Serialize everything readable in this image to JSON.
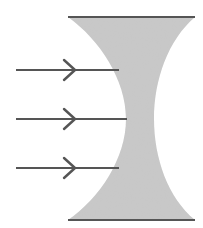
{
  "diagram": {
    "description": "Diverging (biconcave) lens with three parallel incoming rays",
    "colors": {
      "background": "#ffffff",
      "lens_fill": "#c9c9c9",
      "lens_edge": "#555555",
      "ray": "#555555"
    },
    "lens": {
      "type": "biconcave",
      "top_y": 17,
      "bottom_y": 220,
      "left_x": 68,
      "right_x": 195,
      "waist_left_x": 126,
      "waist_right_x": 154
    },
    "rays": [
      {
        "y": 70,
        "x_start": 16,
        "x_end": 119,
        "arrow_x": 75,
        "direction": "right"
      },
      {
        "y": 119,
        "x_start": 16,
        "x_end": 127,
        "arrow_x": 75,
        "direction": "right"
      },
      {
        "y": 168,
        "x_start": 16,
        "x_end": 119,
        "arrow_x": 75,
        "direction": "right"
      }
    ]
  }
}
